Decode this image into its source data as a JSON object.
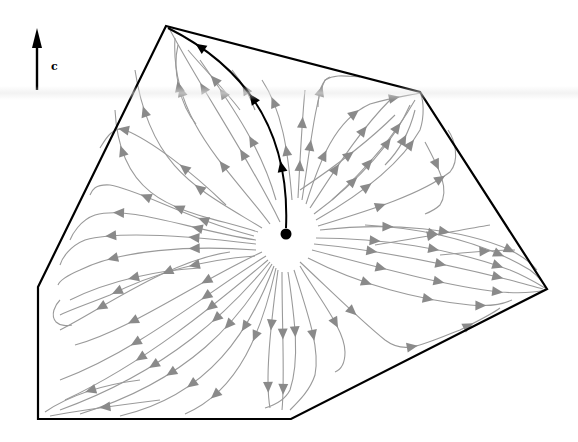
{
  "figure": {
    "cost_direction_label": "c",
    "colors": {
      "boundary": "#000000",
      "streamline": "#9a9a9a",
      "arrowhead": "#8a8a8a",
      "highlight_path": "#000000",
      "center_point": "#000000",
      "background": "#ffffff"
    },
    "polygon_vertices": [
      [
        166,
        26
      ],
      [
        420,
        92
      ],
      [
        547,
        289
      ],
      [
        291,
        419
      ],
      [
        38,
        419
      ],
      [
        38,
        287
      ]
    ],
    "center_point": [
      286,
      234
    ],
    "highlight_path": {
      "from": [
        286,
        228
      ],
      "control": [
        292,
        90
      ],
      "to": [
        168,
        28
      ],
      "arrow_positions": [
        0.25,
        0.55,
        0.85
      ]
    },
    "cost_arrow": {
      "x": 37,
      "y_top": 28,
      "y_bottom": 90
    }
  },
  "streamlines": [
    {
      "d": "M280,222 C250,160 205,95 170,30",
      "arrows": [
        0.35,
        0.7
      ]
    },
    {
      "d": "M270,224 C230,170 170,120 175,38",
      "arrows": [
        0.35,
        0.75
      ]
    },
    {
      "d": "M262,228 C200,190 150,170 135,70",
      "arrows": [
        0.35,
        0.8
      ]
    },
    {
      "d": "M258,232 C190,210 120,210 115,110",
      "arrows": [
        0.4,
        0.8
      ]
    },
    {
      "d": "M196,124 C180,105 172,70 178,45",
      "arrows": [
        0.5
      ]
    },
    {
      "d": "M240,110 C225,90 205,70 188,50",
      "arrows": [
        0.5
      ]
    },
    {
      "d": "M276,200 C262,150 235,110 200,60",
      "arrows": [
        0.4,
        0.75
      ]
    },
    {
      "d": "M226,205 C190,170 150,140 125,130 C112,126 105,140 100,148",
      "arrows": [
        0.35,
        0.8
      ]
    },
    {
      "d": "M254,236 C190,220 140,190 110,185 C95,184 92,190 90,195",
      "arrows": [
        0.3,
        0.65
      ]
    },
    {
      "d": "M256,240 C190,230 130,205 95,215 C80,220 72,235 70,240",
      "arrows": [
        0.3,
        0.7
      ]
    },
    {
      "d": "M256,244 C190,236 120,230 85,240 C70,246 62,258 60,265",
      "arrows": [
        0.3,
        0.7
      ]
    },
    {
      "d": "M256,250 C190,245 120,250 80,270 C66,276 60,280 58,285",
      "arrows": [
        0.3,
        0.7
      ]
    },
    {
      "d": "M200,268 C160,270 110,280 70,300",
      "arrows": [
        0.5
      ]
    },
    {
      "d": "M255,256 C200,260 150,275 110,295 C85,305 70,310 60,315",
      "arrows": [
        0.3,
        0.7
      ]
    },
    {
      "d": "M60,300 C55,305 50,315 56,322 C60,326 68,326 72,325",
      "arrows": []
    },
    {
      "d": "M230,252 C170,260 100,310 60,330",
      "arrows": [
        0.35,
        0.75
      ]
    },
    {
      "d": "M262,252 C200,280 130,330 75,345",
      "arrows": [
        0.3,
        0.7
      ]
    },
    {
      "d": "M266,256 C210,290 140,350 60,380",
      "arrows": [
        0.3,
        0.65
      ]
    },
    {
      "d": "M268,260 C220,300 150,360 65,400",
      "arrows": [
        0.3,
        0.65
      ]
    },
    {
      "d": "M270,262 C230,310 170,370 60,410",
      "arrows": [
        0.3,
        0.6
      ]
    },
    {
      "d": "M272,264 C240,320 190,380 80,414",
      "arrows": [
        0.3,
        0.6
      ]
    },
    {
      "d": "M274,266 C250,330 210,395 120,416",
      "arrows": [
        0.3,
        0.65
      ]
    },
    {
      "d": "M276,268 C262,330 240,390 185,414",
      "arrows": [
        0.4,
        0.8
      ]
    },
    {
      "d": "M160,400 C120,405 80,410 50,416",
      "arrows": [
        0.5
      ]
    },
    {
      "d": "M140,380 C100,385 70,395 45,412",
      "arrows": [
        0.5
      ]
    },
    {
      "d": "M278,270 C270,330 265,380 270,408",
      "arrows": [
        0.4,
        0.85
      ]
    },
    {
      "d": "M282,272 C282,330 285,380 282,410",
      "arrows": [
        0.45,
        0.85
      ]
    },
    {
      "d": "M288,272 C295,320 300,360 290,390 C285,400 275,405 265,408",
      "arrows": [
        0.4
      ]
    },
    {
      "d": "M294,270 C310,320 320,350 315,375 C310,390 300,400 290,410",
      "arrows": [
        0.45
      ]
    },
    {
      "d": "M300,266 C320,300 345,330 345,352 C345,365 340,370 335,372",
      "arrows": [
        0.55
      ]
    },
    {
      "d": "M300,262 C330,290 360,320 385,340 C405,355 420,345 460,330 C480,320 495,312 500,308",
      "arrows": [
        0.3,
        0.6,
        0.85
      ]
    },
    {
      "d": "M308,258 C360,285 420,300 470,305 C495,307 505,303 512,300",
      "arrows": [
        0.3,
        0.6,
        0.85
      ]
    },
    {
      "d": "M312,250 C370,265 440,285 500,292 C525,294 537,292 545,290",
      "arrows": [
        0.3,
        0.55,
        0.8
      ]
    },
    {
      "d": "M314,244 C380,250 450,265 510,280 C525,284 535,287 543,289",
      "arrows": [
        0.25,
        0.55,
        0.8
      ]
    },
    {
      "d": "M316,238 C380,238 450,248 510,270 C525,276 535,282 545,288",
      "arrows": [
        0.25,
        0.5,
        0.78
      ]
    },
    {
      "d": "M365,225 C420,228 480,240 530,270 C538,276 543,282 546,288",
      "arrows": [
        0.35,
        0.7
      ]
    },
    {
      "d": "M320,230 C390,222 460,228 510,250 C522,256 532,264 537,270",
      "arrows": [
        0.3,
        0.55,
        0.85
      ]
    },
    {
      "d": "M440,255 C470,252 495,250 515,250",
      "arrows": [
        0.6
      ]
    },
    {
      "d": "M375,245 C420,238 460,230 490,225",
      "arrows": [
        0.5
      ]
    },
    {
      "d": "M318,226 C370,210 420,195 450,172 C460,160 455,140 448,130",
      "arrows": [
        0.35,
        0.7
      ]
    },
    {
      "d": "M316,220 C360,195 400,165 420,130 C425,115 423,100 421,95",
      "arrows": [
        0.35,
        0.7
      ]
    },
    {
      "d": "M314,214 C360,180 395,140 410,105",
      "arrows": [
        0.35,
        0.7
      ]
    },
    {
      "d": "M332,200 C365,170 395,135 415,100",
      "arrows": [
        0.4,
        0.75
      ]
    },
    {
      "d": "M310,208 C335,170 360,130 390,100",
      "arrows": [
        0.35,
        0.7
      ]
    },
    {
      "d": "M306,204 C320,160 335,120 370,104 C390,98 405,96 420,93",
      "arrows": [
        0.3,
        0.6,
        0.85
      ]
    },
    {
      "d": "M302,200 C310,150 315,100 325,80 C335,74 345,76 360,77",
      "arrows": [
        0.35,
        0.7
      ]
    },
    {
      "d": "M298,198 C300,160 302,120 305,90",
      "arrows": [
        0.3,
        0.7
      ]
    },
    {
      "d": "M318,107 C318,92 322,80 330,77",
      "arrows": []
    },
    {
      "d": "M425,142 C440,170 450,190 440,205 C435,210 430,212 425,214",
      "arrows": [
        0.3
      ]
    },
    {
      "d": "M385,165 C400,150 410,130 415,110",
      "arrows": [
        0.5
      ]
    },
    {
      "d": "M292,200 C288,150 282,110 262,80",
      "arrows": [
        0.4,
        0.8
      ]
    },
    {
      "d": "M255,110 C250,95 240,80 232,70",
      "arrows": [
        0.5
      ]
    },
    {
      "d": "M300,190 C330,170 365,145 395,115",
      "arrows": [
        0.5
      ]
    }
  ]
}
